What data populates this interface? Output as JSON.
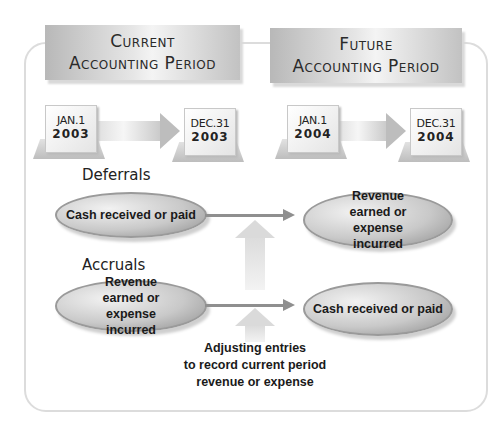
{
  "periods": {
    "current": {
      "line1": "Current",
      "line2": "Accounting Period"
    },
    "future": {
      "line1": "Future",
      "line2": "Accounting Period"
    }
  },
  "calendars": [
    {
      "month_day": "JAN.1",
      "year": "2003"
    },
    {
      "month_day": "DEC.31",
      "year": "2003"
    },
    {
      "month_day": "JAN.1",
      "year": "2004"
    },
    {
      "month_day": "DEC.31",
      "year": "2004"
    }
  ],
  "deferrals": {
    "label": "Deferrals",
    "current_node": "Cash received or paid",
    "future_node": "Revenue earned or expense incurred"
  },
  "accruals": {
    "label": "Accruals",
    "current_node": "Revenue earned or expense incurred",
    "future_node": "Cash received or paid"
  },
  "adjusting": {
    "line1": "Adjusting entries",
    "line2": "to record current period",
    "line3": "revenue or expense"
  }
}
